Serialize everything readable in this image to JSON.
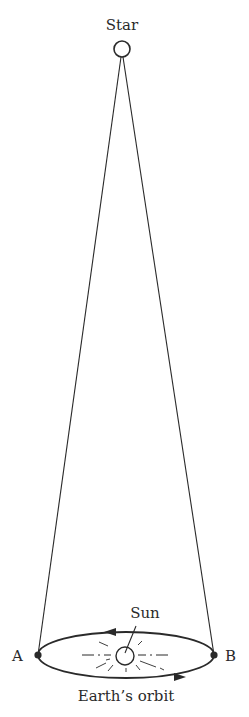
{
  "diagram": {
    "labels": {
      "star": "Star",
      "sun": "Sun",
      "point_a": "A",
      "point_b": "B",
      "orbit": "Earth’s orbit"
    },
    "colors": {
      "ink": "#2a2a2a",
      "background": "#ffffff"
    }
  }
}
